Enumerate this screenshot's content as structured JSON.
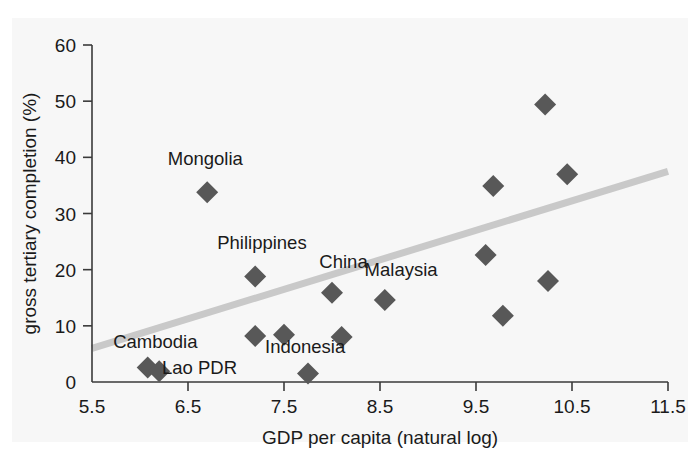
{
  "chart_data": {
    "type": "scatter",
    "title": "",
    "xlabel": "GDP per capita (natural log)",
    "ylabel": "gross tertiary completion (%)",
    "xlim": [
      5.5,
      11.5
    ],
    "ylim": [
      0,
      60
    ],
    "xticks": [
      "5.5",
      "6.5",
      "7.5",
      "8.5",
      "9.5",
      "10.5",
      "11.5"
    ],
    "xtick_values": [
      5.5,
      6.5,
      7.5,
      8.5,
      9.5,
      10.5,
      11.5
    ],
    "yticks": [
      "0",
      "10",
      "20",
      "30",
      "40",
      "50",
      "60"
    ],
    "ytick_values": [
      0,
      10,
      20,
      30,
      40,
      50,
      60
    ],
    "grid": false,
    "legend": "none",
    "marker": "diamond",
    "marker_color": "#585858",
    "trendline": {
      "color": "#c9c9c9",
      "x_start": 5.5,
      "y_start": 6.0,
      "x_end": 11.5,
      "y_end": 37.5
    },
    "points": [
      {
        "label": "Cambodia",
        "x": 6.08,
        "y": 2.6
      },
      {
        "label": "Lao PDR",
        "x": 6.2,
        "y": 1.9
      },
      {
        "label": "Mongolia",
        "x": 6.7,
        "y": 33.8
      },
      {
        "label": "Philippines",
        "x": 7.2,
        "y": 18.8
      },
      {
        "label": "",
        "x": 7.2,
        "y": 8.2
      },
      {
        "label": "",
        "x": 7.5,
        "y": 8.4
      },
      {
        "label": "Indonesia",
        "x": 7.75,
        "y": 1.5
      },
      {
        "label": "China",
        "x": 8.0,
        "y": 15.9
      },
      {
        "label": "",
        "x": 8.1,
        "y": 8.0
      },
      {
        "label": "Malaysia",
        "x": 8.55,
        "y": 14.6
      },
      {
        "label": "",
        "x": 9.6,
        "y": 22.6
      },
      {
        "label": "",
        "x": 9.68,
        "y": 34.9
      },
      {
        "label": "",
        "x": 9.78,
        "y": 11.8
      },
      {
        "label": "",
        "x": 10.22,
        "y": 49.4
      },
      {
        "label": "",
        "x": 10.25,
        "y": 18.0
      },
      {
        "label": "",
        "x": 10.45,
        "y": 37.0
      }
    ],
    "annotations": [
      {
        "text": "Mongolia",
        "x": 6.68,
        "y": 38.6,
        "anchor": "middle"
      },
      {
        "text": "Philippines",
        "x": 7.27,
        "y": 23.7,
        "anchor": "middle"
      },
      {
        "text": "China",
        "x": 8.12,
        "y": 20.3,
        "anchor": "middle"
      },
      {
        "text": "Malaysia",
        "x": 8.72,
        "y": 18.8,
        "anchor": "middle"
      },
      {
        "text": "Indonesia",
        "x": 7.72,
        "y": 5.1,
        "anchor": "middle"
      },
      {
        "text": "Cambodia",
        "x": 6.16,
        "y": 6.1,
        "anchor": "middle"
      },
      {
        "text": "Lao PDR",
        "x": 6.62,
        "y": 1.4,
        "anchor": "middle"
      }
    ]
  }
}
